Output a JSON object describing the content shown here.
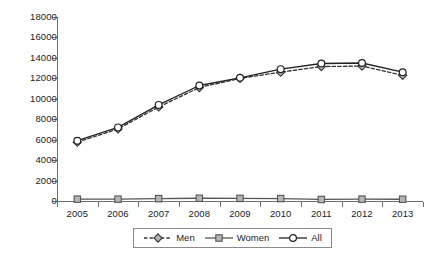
{
  "chart_data": {
    "type": "line",
    "title": "",
    "subtitle": "",
    "xlabel": "",
    "ylabel": "",
    "categories": [
      "2005",
      "2006",
      "2007",
      "2008",
      "2009",
      "2010",
      "2011",
      "2012",
      "2013"
    ],
    "series": [
      {
        "name": "Men",
        "marker": "diamond",
        "line_style": "dashed",
        "color": "#333333",
        "values": [
          5750,
          7050,
          9200,
          11100,
          12000,
          12600,
          13150,
          13200,
          12300
        ]
      },
      {
        "name": "Women",
        "marker": "square",
        "line_style": "solid",
        "color": "#555555",
        "values": [
          180,
          180,
          230,
          270,
          260,
          240,
          150,
          180,
          170
        ]
      },
      {
        "name": "All",
        "marker": "circle",
        "line_style": "solid",
        "color": "#222222",
        "values": [
          5900,
          7200,
          9400,
          11300,
          12050,
          12900,
          13450,
          13500,
          12600
        ]
      }
    ],
    "ylim": [
      0,
      18000
    ],
    "y_ticks": [
      0,
      2000,
      4000,
      6000,
      8000,
      10000,
      12000,
      14000,
      16000,
      18000
    ],
    "y_tick_labels": [
      "0",
      "2000",
      "4000",
      "6000",
      "8000",
      "10000",
      "12000",
      "14000",
      "16000",
      "18000"
    ],
    "grid": false,
    "legend_position": "bottom",
    "legend_entries": [
      "Men",
      "Women",
      "All"
    ]
  },
  "colors": {
    "axis": "#6e6e6e",
    "text": "#1c1c1c",
    "men": "#333333",
    "women": "#555555",
    "all": "#222222",
    "marker_fill": "#b5b5b5",
    "legend_border": "#8a8a8a",
    "background": "#ffffff"
  }
}
